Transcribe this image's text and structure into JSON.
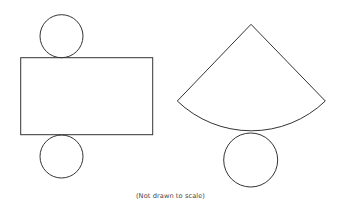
{
  "diagram": {
    "stroke_color": "#333333",
    "cylinder_net": {
      "top_circle": {
        "cx": 61.5,
        "cy": 36.2,
        "r": 21.5
      },
      "rectangle": {
        "x": 20.7,
        "y": 57.7,
        "width": 132,
        "height": 77
      },
      "bottom_circle": {
        "cx": 61.5,
        "cy": 156.5,
        "r": 21.5
      }
    },
    "cone_net": {
      "sector": {
        "apex_x": 251,
        "apex_y": 24.3,
        "left_x": 177.3,
        "left_y": 101,
        "right_x": 325.3,
        "right_y": 101,
        "radius": 106.8
      },
      "base_circle": {
        "cx": 250.7,
        "cy": 160,
        "r": 27
      }
    },
    "caption": "(Not drawn to scale)"
  }
}
